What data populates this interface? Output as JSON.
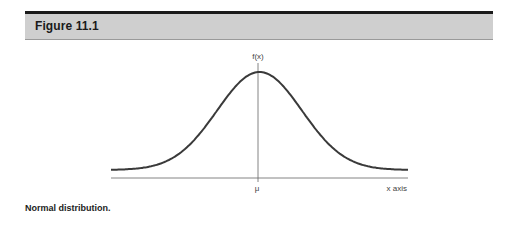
{
  "figure": {
    "title": "Figure 11.1",
    "caption": "Normal distribution."
  },
  "chart_data": {
    "type": "line",
    "title": "Figure 11.1",
    "subtitle": "Normal distribution.",
    "xlabel": "x axis",
    "ylabel": "f(x)",
    "x_tick_labels": [
      "μ"
    ],
    "series": [
      {
        "name": "f(x)",
        "description": "Normal distribution bell curve centered at μ",
        "mean": 0,
        "std": 1,
        "x": [
          -3.5,
          -3,
          -2.5,
          -2,
          -1.5,
          -1,
          -0.5,
          0,
          0.5,
          1,
          1.5,
          2,
          2.5,
          3,
          3.5
        ],
        "values": [
          0.0009,
          0.0044,
          0.0175,
          0.054,
          0.1295,
          0.242,
          0.3521,
          0.3989,
          0.3521,
          0.242,
          0.1295,
          0.054,
          0.0175,
          0.0044,
          0.0009
        ]
      }
    ],
    "xlim": [
      -3.5,
      3.5
    ],
    "grid": false,
    "legend": "none"
  },
  "labels": {
    "y_axis": "f(x)",
    "x_axis": "x axis",
    "mean": "μ"
  },
  "colors": {
    "header_band": "#cfcfcf",
    "header_rule": "#1a1a1a",
    "curve": "#3a3a3a",
    "axis": "#555555"
  }
}
